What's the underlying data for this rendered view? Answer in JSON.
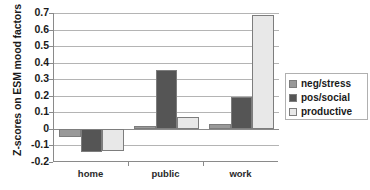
{
  "chart_data": {
    "type": "bar",
    "title": "",
    "xlabel": "",
    "ylabel": "Z-scores on ESM mood factors",
    "categories": [
      "home",
      "public",
      "work"
    ],
    "series": [
      {
        "name": "neg/stress",
        "color": "#999999",
        "values": [
          -0.05,
          0.02,
          0.03
        ]
      },
      {
        "name": "pos/social",
        "color": "#555555",
        "values": [
          -0.14,
          0.355,
          0.195
        ]
      },
      {
        "name": "productive",
        "color": "#e8e8e8",
        "values": [
          -0.135,
          0.07,
          0.69
        ]
      }
    ],
    "ylim": [
      -0.2,
      0.7
    ],
    "ytick_step": 0.1,
    "ytick_labels": [
      "0.7",
      "0.6",
      "0.5",
      "0.4",
      "0.3",
      "0.2",
      "0.1",
      "0",
      "-0.1",
      "-0.2"
    ],
    "ytick_values": [
      0.7,
      0.6,
      0.5,
      0.4,
      0.3,
      0.2,
      0.1,
      0,
      -0.1,
      -0.2
    ],
    "grid": true,
    "legend_position": "right",
    "legend_entries": [
      "neg/stress",
      "pos/social",
      "productive"
    ]
  },
  "axis_colors": {
    "gridline": "#b4b4b4",
    "axis": "#8a8a8a",
    "bar_border": "#7d7d7d",
    "text": "#1a1a1a"
  }
}
